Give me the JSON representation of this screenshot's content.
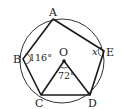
{
  "diagram": {
    "type": "inscribed-pentagon",
    "circle": {
      "cx": 62,
      "cy": 61,
      "r": 42
    },
    "center": {
      "label": "O",
      "x": 64,
      "y": 61
    },
    "points": [
      {
        "id": "A",
        "label": "A",
        "x": 53,
        "y": 19
      },
      {
        "id": "B",
        "label": "B",
        "x": 23,
        "y": 59
      },
      {
        "id": "C",
        "label": "C",
        "x": 41,
        "y": 95
      },
      {
        "id": "D",
        "label": "D",
        "x": 90,
        "y": 95
      },
      {
        "id": "E",
        "label": "E",
        "x": 104,
        "y": 51
      }
    ],
    "angles": {
      "B": "116°",
      "O": "72°",
      "E": "x"
    },
    "stroke_color": "#1a1a1a"
  }
}
